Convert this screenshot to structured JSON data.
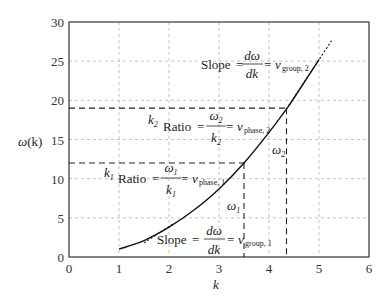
{
  "chart_data": {
    "type": "line",
    "title": "",
    "xlabel": "k",
    "ylabel": "ω(k)",
    "xlim": [
      0,
      6
    ],
    "ylim": [
      0,
      30
    ],
    "x_ticks": [
      "0",
      "1",
      "2",
      "3",
      "4",
      "5",
      "6"
    ],
    "y_ticks": [
      "0",
      "5",
      "10",
      "15",
      "20",
      "25",
      "30"
    ],
    "grid": true,
    "series": [
      {
        "name": "dispersion curve ω(k)",
        "style": "solid",
        "x": [
          1.0,
          1.5,
          2.0,
          2.5,
          3.0,
          3.5,
          4.0,
          4.35,
          4.5,
          5.0
        ],
        "y": [
          1.0,
          2.1,
          3.8,
          6.0,
          8.7,
          12.0,
          15.9,
          18.9,
          20.3,
          25.2
        ]
      },
      {
        "name": "tangent at k1",
        "style": "dotted",
        "x": [
          1.5,
          2.1
        ],
        "y": [
          1.8,
          4.3
        ]
      },
      {
        "name": "tangent at k2",
        "style": "dotted",
        "x": [
          4.35,
          5.25
        ],
        "y": [
          18.9,
          27.6
        ]
      }
    ],
    "markers": {
      "k1": 3.5,
      "omega1": 12,
      "k2": 4.35,
      "omega2": 19
    },
    "annotations": [
      {
        "text": "Slope = dω/dk = v_group, 2",
        "x": 3.9,
        "y": 24.5
      },
      {
        "text": "k₂",
        "x": 2.5,
        "y": 17.3
      },
      {
        "text": "Ratio = ω₂/k₂ = v_phase, 2",
        "x": 2.7,
        "y": 16.3
      },
      {
        "text": "k₁",
        "x": 0.5,
        "y": 10.6
      },
      {
        "text": "Ratio = ω₁/k₁ = v_phase, 1",
        "x": 0.6,
        "y": 10.0
      },
      {
        "text": "ω₁",
        "x": 3.0,
        "y": 7.0
      },
      {
        "text": "ω₂",
        "x": 4.0,
        "y": 14.0
      },
      {
        "text": "Slope = dω/dk = v_group, 1",
        "x": 1.6,
        "y": 2.0
      }
    ],
    "legend": "none"
  },
  "labels": {
    "xlabel": "k",
    "ylabel_omega": "ω",
    "ylabel_arg": "(k)",
    "slope_word": "Slope",
    "ratio_word": "Ratio",
    "eq": "=",
    "d_omega": "dω",
    "dk": "dk",
    "v": "v",
    "group2": "group, 2",
    "group1": "group, 1",
    "phase2": "phase, 2",
    "phase1": "phase, 1",
    "omega": "ω",
    "k": "k",
    "one": "1",
    "two": "2"
  }
}
